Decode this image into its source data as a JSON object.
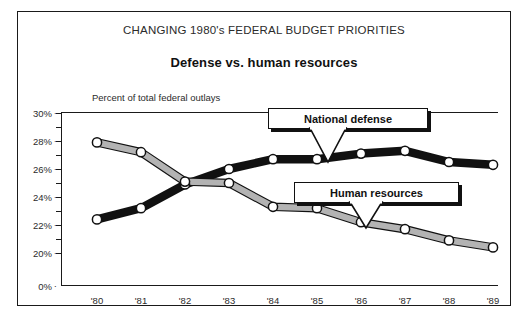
{
  "chart_data": {
    "type": "line",
    "title": "CHANGING 1980's FEDERAL BUDGET PRIORITIES",
    "subtitle": "Defense vs. human resources",
    "ylabel": "Percent of total federal outlays",
    "xlabel": "",
    "categories": [
      "'80",
      "'81",
      "'82",
      "'83",
      "'84",
      "'85",
      "'86",
      "'87",
      "'88",
      "'89"
    ],
    "ytick_labels": [
      "30%",
      "28%",
      "26%",
      "24%",
      "22%",
      "20%",
      "0%"
    ],
    "ytick_values": [
      30,
      28,
      26,
      24,
      22,
      20,
      0
    ],
    "ylim": [
      19.5,
      30
    ],
    "axis_break": true,
    "grid": false,
    "legend_position": "callout-labels",
    "series": [
      {
        "name": "National defense",
        "color": "#111111",
        "marker": "open-circle",
        "values": [
          22.4,
          23.2,
          24.9,
          26.0,
          26.7,
          26.7,
          27.1,
          27.3,
          26.5,
          26.3
        ]
      },
      {
        "name": "Human resources",
        "color": "#b3b3b3",
        "marker": "open-circle",
        "values": [
          27.9,
          27.2,
          25.1,
          25.0,
          23.3,
          23.2,
          22.2,
          21.7,
          20.9,
          20.4
        ]
      }
    ],
    "annotations": [
      {
        "text": "National defense",
        "target_series": "National defense",
        "target_category": "'84"
      },
      {
        "text": "Human resources",
        "target_series": "Human resources",
        "target_category": "'85"
      }
    ]
  }
}
